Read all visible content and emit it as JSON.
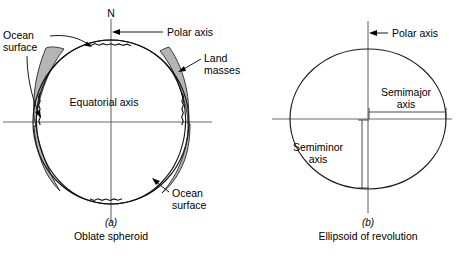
{
  "figure": {
    "colors": {
      "land_fill": "#b5b5b5",
      "outline": "#1a1a1a",
      "axis": "#6b6b6b",
      "background": "#ffffff",
      "text": "#000000"
    }
  },
  "panel_a": {
    "caption_letter": "(a)",
    "caption_title": "Oblate spheroid",
    "north_label": "N",
    "polar_axis_label": "Polar axis",
    "equatorial_axis_label": "Equatorial axis",
    "ocean_surface_label_line1": "Ocean",
    "ocean_surface_label_line2": "surface",
    "ocean_surface_label2_line1": "Ocean",
    "ocean_surface_label2_line2": "surface",
    "land_masses_label_line1": "Land",
    "land_masses_label_line2": "masses"
  },
  "panel_b": {
    "caption_letter": "(b)",
    "caption_title": "Ellipsoid of revolution",
    "polar_axis_label": "Polar axis",
    "semimajor_label_line1": "Semimajor",
    "semimajor_label_line2": "axis",
    "semiminor_label_line1": "Semiminor",
    "semiminor_label_line2": "axis"
  }
}
